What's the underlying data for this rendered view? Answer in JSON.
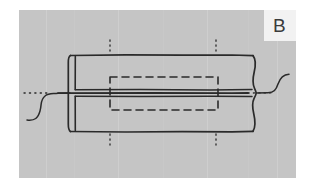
{
  "figure": {
    "panel_label": "B",
    "background_color": "#ffffff",
    "panel_color": "#c5c5c5",
    "label_box_color": "#f2f2f2",
    "line_color": "#2a2a2a",
    "panel": {
      "x": 19,
      "y": 10,
      "width": 277,
      "height": 168
    },
    "label_box": {
      "x": 264,
      "y": 10,
      "width": 32,
      "height": 31
    }
  },
  "chart_data": {
    "type": "diagram",
    "title": "B",
    "elements": [
      {
        "name": "tube-outline",
        "kind": "polyline",
        "stroke": "#2a2a2a",
        "stroke_width": 1.6,
        "note": "Outer body of the tube, slightly irregular hand-drawn rectangle."
      },
      {
        "name": "tube-left-wall",
        "kind": "line",
        "x": 70,
        "y1": 55,
        "y2": 132,
        "note": "Inner wall line at the left end of the tube."
      },
      {
        "name": "axis-centerline",
        "kind": "line",
        "y": 93,
        "x1": 24,
        "x2": 292,
        "note": "Horizontal axis of revolution, solid through the body and dotted beyond the break lines."
      },
      {
        "name": "hidden-detail-rectangle",
        "kind": "dashed-rect",
        "x": 110,
        "y": 77,
        "width": 108,
        "height": 33,
        "dash": "7 5",
        "note": "Dashed rectangle indicating a hidden internal feature."
      },
      {
        "name": "section-line-upper-left",
        "kind": "dotted-vertical",
        "x": 110,
        "y1": 40,
        "y2": 56
      },
      {
        "name": "section-line-upper-right",
        "kind": "dotted-vertical",
        "x": 216,
        "y1": 40,
        "y2": 56
      },
      {
        "name": "section-line-lower-left",
        "kind": "dotted-vertical",
        "x": 110,
        "y1": 131,
        "y2": 147
      },
      {
        "name": "section-line-lower-right",
        "kind": "dotted-vertical",
        "x": 216,
        "y1": 131,
        "y2": 147
      },
      {
        "name": "break-line-left",
        "kind": "freehand-s-curve",
        "note": "S-shaped break line at the left, indicating the part continues."
      },
      {
        "name": "break-line-right",
        "kind": "freehand-s-curve",
        "note": "S-shaped break line at the right, indicating the part continues."
      }
    ]
  }
}
